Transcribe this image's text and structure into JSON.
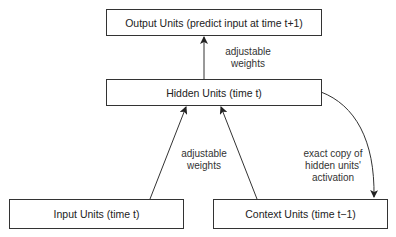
{
  "diagram": {
    "nodes": {
      "output": "Output Units (predict input at time t+1)",
      "hidden": "Hidden Units (time t)",
      "input": "Input Units (time t)",
      "context": "Context Units (time t−1)"
    },
    "edges": {
      "hidden_to_output": {
        "line1": "adjustable",
        "line2": "weights"
      },
      "to_hidden": {
        "line1": "adjustable",
        "line2": "weights"
      },
      "hidden_to_context": {
        "line1": "exact copy of",
        "line2": "hidden units'",
        "line3": "activation"
      }
    },
    "colors": {
      "stroke": "#333333",
      "text": "#222222",
      "background": "#ffffff"
    }
  }
}
